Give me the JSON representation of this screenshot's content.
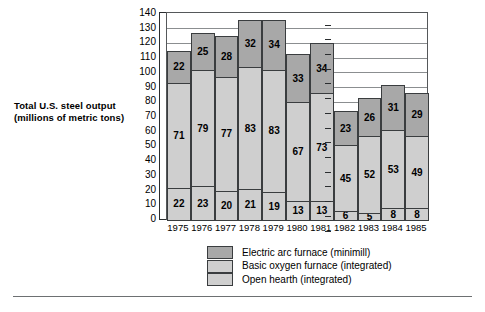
{
  "caption": {
    "line1": "Total U.S. steel output",
    "line2": "(millions of metric tons)"
  },
  "legend": {
    "items": [
      {
        "label": "Electric arc furnace (minimill)",
        "key": "electric",
        "color": "#a8a8a8"
      },
      {
        "label": "Basic oxygen furnace (integrated)",
        "key": "basic",
        "color": "#cfcfcf"
      },
      {
        "label": "Open hearth (integrated)",
        "key": "openhearth",
        "color": "#cfcfcf"
      }
    ]
  },
  "chart_data": {
    "type": "bar",
    "subtype": "stacked-column",
    "title": "Total U.S. steel output (millions of metric tons)",
    "xlabel": "",
    "ylabel": "Total U.S. steel output (millions of metric tons)",
    "ylim": [
      0,
      140
    ],
    "ytick_step": 10,
    "yticks": [
      0,
      10,
      20,
      30,
      40,
      50,
      60,
      70,
      80,
      90,
      100,
      110,
      120,
      130,
      140
    ],
    "grid": true,
    "grid_axis": "y",
    "legend_position": "bottom-center",
    "categories": [
      "1975",
      "1976",
      "1977",
      "1978",
      "1979",
      "1980",
      "1981",
      "1982",
      "1983",
      "1984",
      "1985"
    ],
    "series": [
      {
        "name": "Open hearth (integrated)",
        "stack_order": 0,
        "color": "#cfcfcf",
        "values": [
          22,
          23,
          20,
          21,
          19,
          13,
          13,
          6,
          5,
          8,
          8
        ]
      },
      {
        "name": "Basic oxygen furnace (integrated)",
        "stack_order": 1,
        "color": "#cfcfcf",
        "values": [
          71,
          79,
          77,
          83,
          83,
          67,
          73,
          45,
          52,
          53,
          49
        ]
      },
      {
        "name": "Electric arc furnace (minimill)",
        "stack_order": 2,
        "color": "#a8a8a8",
        "values": [
          22,
          25,
          28,
          32,
          34,
          33,
          34,
          23,
          26,
          31,
          29
        ]
      }
    ],
    "totals": [
      115,
      127,
      125,
      136,
      136,
      113,
      120,
      74,
      83,
      92,
      86
    ]
  }
}
